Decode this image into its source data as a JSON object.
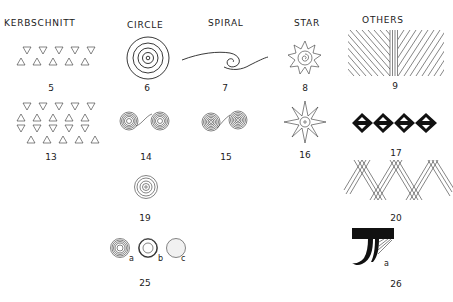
{
  "headers": {
    "kerbschnitt": "KERBSCHNITT",
    "circle": "CIRCLE",
    "spiral": "SPIRAL",
    "star": "STAR",
    "others": "OTHERS"
  },
  "figures": [
    {
      "id": "5",
      "category": "Kerbschnitt",
      "label": "5"
    },
    {
      "id": "6",
      "category": "Circle",
      "label": "6"
    },
    {
      "id": "7",
      "category": "Spiral",
      "label": "7"
    },
    {
      "id": "8",
      "category": "Star",
      "label": "8"
    },
    {
      "id": "9",
      "category": "Others",
      "label": "9"
    },
    {
      "id": "13",
      "category": "Kerbschnitt",
      "label": "13"
    },
    {
      "id": "14",
      "category": "Circle",
      "label": "14"
    },
    {
      "id": "15",
      "category": "Spiral",
      "label": "15"
    },
    {
      "id": "16",
      "category": "Star",
      "label": "16"
    },
    {
      "id": "17",
      "category": "Others",
      "label": "17"
    },
    {
      "id": "19",
      "category": "Circle",
      "label": "19"
    },
    {
      "id": "20",
      "category": "Others",
      "label": "20"
    },
    {
      "id": "25",
      "category": "Circle",
      "label": "25",
      "sublabels": [
        "a",
        "b",
        "c"
      ]
    },
    {
      "id": "26",
      "category": "Others",
      "label": "26",
      "sublabels": [
        "a"
      ]
    }
  ]
}
